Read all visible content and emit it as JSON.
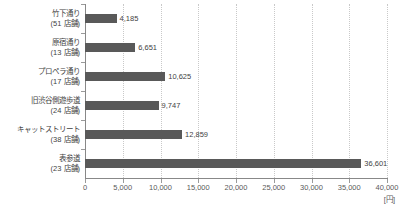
{
  "chart_data": {
    "type": "bar",
    "orientation": "horizontal",
    "title": "",
    "xlabel": "[円]",
    "ylabel": "",
    "xlim": [
      0,
      40000
    ],
    "xticks": [
      "0",
      "5,000",
      "10,000",
      "15,000",
      "20,000",
      "25,000",
      "30,000",
      "35,000",
      "40,000"
    ],
    "xtick_values": [
      0,
      5000,
      10000,
      15000,
      20000,
      25000,
      30000,
      35000,
      40000
    ],
    "grid": "vertical-dotted",
    "legend": "none",
    "bar_color": "#595959",
    "categories": [
      "竹下通り\n(51 店舗)",
      "原宿通り\n(13 店舗)",
      "プロペラ通り\n(17 店舗)",
      "旧渋谷側遊歩道\n(24 店舗)",
      "キャットストリート\n(38 店舗)",
      "表参道\n(23 店舗)"
    ],
    "values": [
      4185,
      6651,
      10625,
      9747,
      12859,
      36601
    ],
    "value_labels": [
      "4,185",
      "6,651",
      "10,625",
      "9,747",
      "12,859",
      "36,601"
    ],
    "bars": [
      {
        "name": "竹下通り",
        "shops": "(51 店舗)",
        "value": 4185,
        "value_label": "4,185"
      },
      {
        "name": "原宿通り",
        "shops": "(13 店舗)",
        "value": 6651,
        "value_label": "6,651"
      },
      {
        "name": "プロペラ通り",
        "shops": "(17 店舗)",
        "value": 10625,
        "value_label": "10,625"
      },
      {
        "name": "旧渋谷側遊歩道",
        "shops": "(24 店舗)",
        "value": 9747,
        "value_label": "9,747"
      },
      {
        "name": "キャットストリート",
        "shops": "(38 店舗)",
        "value": 12859,
        "value_label": "12,859"
      },
      {
        "name": "表参道",
        "shops": "(23 店舗)",
        "value": 36601,
        "value_label": "36,601"
      }
    ]
  }
}
